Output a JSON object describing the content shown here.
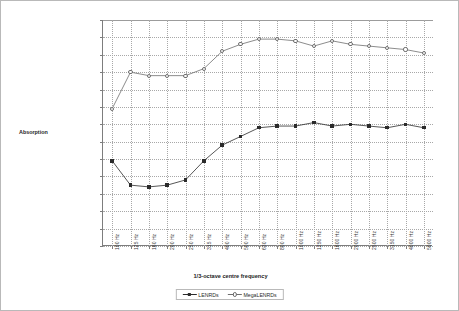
{
  "chart_data": {
    "type": "line",
    "title": "",
    "xlabel": "1/3-octave centre frequency",
    "ylabel": "Absorption",
    "ylim": [
      0,
      13
    ],
    "ytick_step": 1,
    "yunit": "Sabl/unit",
    "grid": true,
    "legend_position": "bottom",
    "categories": [
      "100 Hz",
      "125 Hz",
      "160 Hz",
      "200 Hz",
      "250 Hz",
      "315 Hz",
      "400 Hz",
      "500 Hz",
      "630 Hz",
      "800 Hz",
      "1000 Hz",
      "1250 Hz",
      "1600 Hz",
      "2000 Hz",
      "2500 Hz",
      "3150 Hz",
      "4000 Hz",
      "5000 Hz"
    ],
    "ytick_labels": [
      "13 Sabl/unit",
      "12 Sabl/unit",
      "11 Sabl/unit",
      "10 Sabl/unit",
      "9 Sabl/unit",
      "8 Sabl/unit",
      "7 Sabl/unit",
      "6 Sabl/unit",
      "5 Sabl/unit",
      "4 Sabl/unit",
      "3 Sabl/unit",
      "2 Sabl/unit",
      "1 Sabl/unit",
      "0 Sabl/unit"
    ],
    "series": [
      {
        "name": "LENRDs",
        "marker": "filled-square",
        "color": "#2b2b2b",
        "values": [
          4.9,
          3.5,
          3.4,
          3.5,
          3.8,
          4.9,
          5.8,
          6.3,
          6.8,
          6.9,
          6.9,
          7.1,
          6.9,
          7.0,
          6.9,
          6.8,
          7.0,
          6.8
        ]
      },
      {
        "name": "MegaLENRDs",
        "marker": "open-circle",
        "color": "#6e6e6e",
        "values": [
          7.9,
          10.0,
          9.8,
          9.8,
          9.8,
          10.2,
          11.2,
          11.6,
          11.9,
          11.9,
          11.8,
          11.5,
          11.8,
          11.6,
          11.5,
          11.4,
          11.3,
          11.1
        ]
      }
    ]
  },
  "legend": {
    "entries": [
      {
        "label": "LENRDs"
      },
      {
        "label": "MegaLENRDs"
      }
    ]
  }
}
